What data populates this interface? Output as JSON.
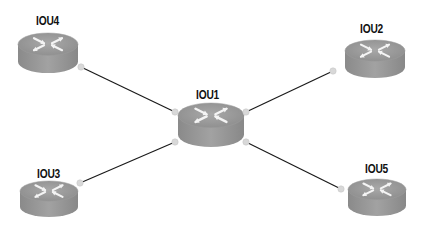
{
  "diagram": {
    "type": "network-topology",
    "colors": {
      "background": "#ffffff",
      "router_top": "#9a9a9a",
      "router_side": "#888888",
      "router_arrows": "#f4f4f4",
      "link": "#1a1a1a",
      "port_dot": "#d8d8d8"
    },
    "nodes": [
      {
        "id": "IOU1",
        "label": "IOU1",
        "icon": "router-icon",
        "label_x": 196,
        "label_y": 88,
        "x": 178,
        "y": 103,
        "w": 66,
        "h": 44
      },
      {
        "id": "IOU2",
        "label": "IOU2",
        "icon": "router-icon",
        "label_x": 360,
        "label_y": 22,
        "x": 345,
        "y": 40,
        "w": 60,
        "h": 38
      },
      {
        "id": "IOU3",
        "label": "IOU3",
        "icon": "router-icon",
        "label_x": 37,
        "label_y": 167,
        "x": 20,
        "y": 181,
        "w": 58,
        "h": 36
      },
      {
        "id": "IOU4",
        "label": "IOU4",
        "icon": "router-icon",
        "label_x": 36,
        "label_y": 14,
        "x": 18,
        "y": 33,
        "w": 60,
        "h": 40
      },
      {
        "id": "IOU5",
        "label": "IOU5",
        "icon": "router-icon",
        "label_x": 365,
        "label_y": 162,
        "x": 348,
        "y": 179,
        "w": 58,
        "h": 37
      }
    ],
    "links": [
      {
        "from": "IOU4",
        "to": "IOU1",
        "x1": 81,
        "y1": 67,
        "x2": 175,
        "y2": 112
      },
      {
        "from": "IOU2",
        "to": "IOU1",
        "x1": 333,
        "y1": 71,
        "x2": 246,
        "y2": 112
      },
      {
        "from": "IOU3",
        "to": "IOU1",
        "x1": 80,
        "y1": 183,
        "x2": 175,
        "y2": 142
      },
      {
        "from": "IOU5",
        "to": "IOU1",
        "x1": 341,
        "y1": 189,
        "x2": 246,
        "y2": 142
      }
    ]
  }
}
